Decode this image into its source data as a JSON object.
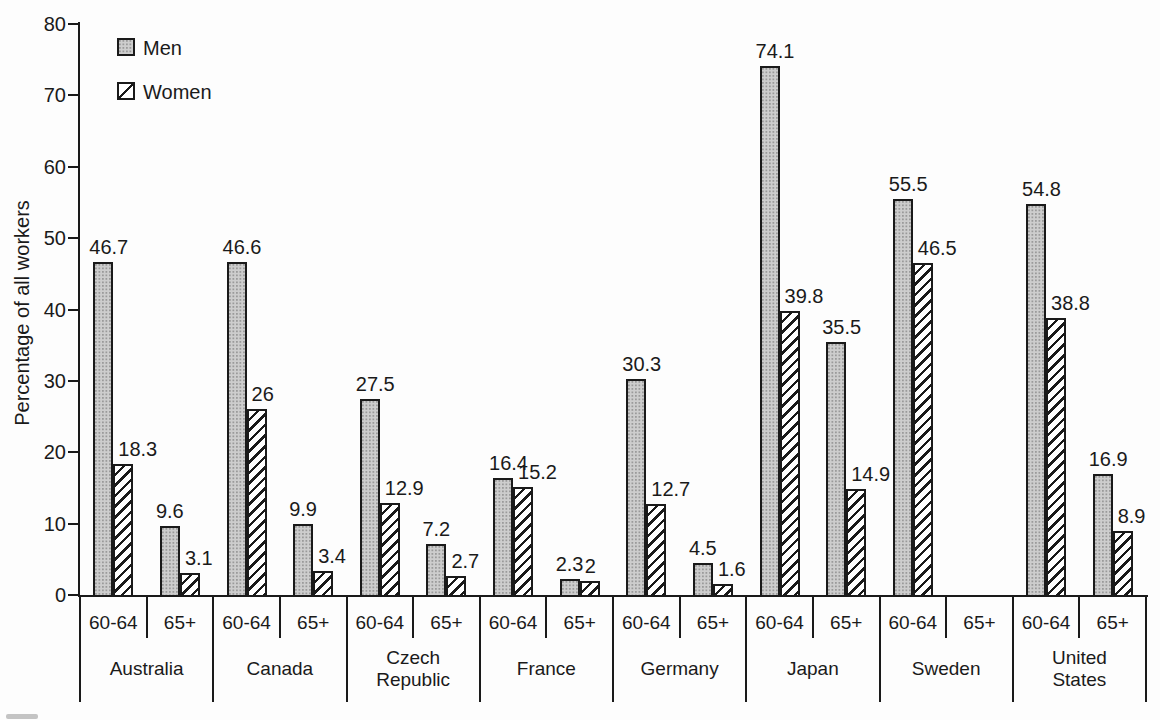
{
  "figure": {
    "ylabel": "Percentage of all workers",
    "legend": {
      "men_label": "Men",
      "women_label": "Women"
    }
  },
  "chart_data": {
    "type": "bar",
    "title": "",
    "xlabel": "",
    "ylabel": "Percentage of all workers",
    "ylim": [
      0,
      80
    ],
    "yticks": [
      0,
      10,
      20,
      30,
      40,
      50,
      60,
      70,
      80
    ],
    "grid": false,
    "legend_position": "top-left",
    "series_names": [
      "Men",
      "Women"
    ],
    "age_groups": [
      "60-64",
      "65+"
    ],
    "categories": [
      "Australia",
      "Canada",
      "Czech Republic",
      "France",
      "Germany",
      "Japan",
      "Sweden",
      "United States"
    ],
    "groups": [
      {
        "country": "Australia",
        "bars": [
          {
            "age": "60-64",
            "men": 46.7,
            "women": 18.3
          },
          {
            "age": "65+",
            "men": 9.6,
            "women": 3.1
          }
        ]
      },
      {
        "country": "Canada",
        "bars": [
          {
            "age": "60-64",
            "men": 46.6,
            "women": 26
          },
          {
            "age": "65+",
            "men": 9.9,
            "women": 3.4
          }
        ]
      },
      {
        "country": "Czech Republic",
        "display": "Czech\nRepublic",
        "bars": [
          {
            "age": "60-64",
            "men": 27.5,
            "women": 12.9
          },
          {
            "age": "65+",
            "men": 7.2,
            "women": 2.7
          }
        ]
      },
      {
        "country": "France",
        "bars": [
          {
            "age": "60-64",
            "men": 16.4,
            "women": 15.2
          },
          {
            "age": "65+",
            "men": 2.3,
            "women": 2
          }
        ]
      },
      {
        "country": "Germany",
        "bars": [
          {
            "age": "60-64",
            "men": 30.3,
            "women": 12.7
          },
          {
            "age": "65+",
            "men": 4.5,
            "women": 1.6
          }
        ]
      },
      {
        "country": "Japan",
        "bars": [
          {
            "age": "60-64",
            "men": 74.1,
            "women": 39.8
          },
          {
            "age": "65+",
            "men": 35.5,
            "women": 14.9
          }
        ]
      },
      {
        "country": "Sweden",
        "bars": [
          {
            "age": "60-64",
            "men": 55.5,
            "women": 46.5
          },
          {
            "age": "65+",
            "men": null,
            "women": null
          }
        ]
      },
      {
        "country": "United States",
        "display": "United\nStates",
        "bars": [
          {
            "age": "60-64",
            "men": 54.8,
            "women": 38.8
          },
          {
            "age": "65+",
            "men": 16.9,
            "women": 8.9
          }
        ]
      }
    ]
  },
  "colors": {
    "axis": "#1a1a1a",
    "text": "#1a1a1a",
    "men_fill": "#cdcdcd",
    "men_stipple": "#9a9a9a",
    "women_fill": "#ffffff",
    "hatch": "#1a1a1a",
    "background": "#fdfdfd"
  }
}
